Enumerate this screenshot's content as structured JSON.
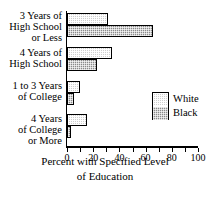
{
  "chart_data": {
    "type": "bar",
    "orientation": "horizontal",
    "title": "",
    "xlabel": "Percent with Specified Level of Education",
    "ylabel": "",
    "xlim": [
      0,
      100
    ],
    "xticks": [
      0,
      10,
      20,
      30,
      40,
      50,
      60,
      70,
      80,
      90,
      100
    ],
    "xticklabels": [
      "0",
      "",
      "20",
      "",
      "40",
      "",
      "60",
      "",
      "80",
      "",
      "100"
    ],
    "grid": false,
    "legend_position": "center-right",
    "categories": [
      "3 Years of High School or Less",
      "4 Years of High School",
      "1 to 3 Years of College",
      "4 Years of College or More"
    ],
    "category_lines": [
      [
        "3 Years of",
        "High School",
        "or Less"
      ],
      [
        "4 Years of",
        "High School"
      ],
      [
        "1 to 3 Years",
        "of  College"
      ],
      [
        "4 Years",
        "of College",
        "or More"
      ]
    ],
    "series": [
      {
        "name": "White",
        "values": [
          31,
          34,
          10,
          15
        ],
        "color": "#cfcfcf"
      },
      {
        "name": "Black",
        "values": [
          66,
          23,
          5,
          3
        ],
        "color": "#8a8a8a"
      }
    ]
  },
  "legend": {
    "items": [
      {
        "label": "White"
      },
      {
        "label": "Black"
      }
    ]
  },
  "axis_title": {
    "line1": "Percent with Specified Level",
    "line2": "of Education"
  }
}
